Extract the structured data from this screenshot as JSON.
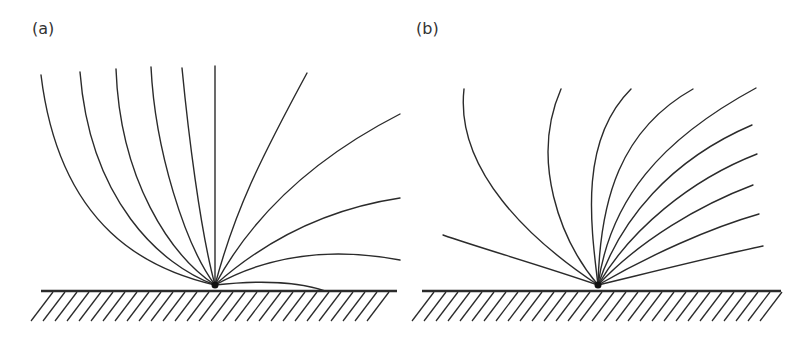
{
  "panels": [
    {
      "label": "(a)",
      "source_point": [
        215,
        285
      ],
      "ground": {
        "x1": 41,
        "x2": 397,
        "y": 291
      },
      "curves": [
        "M215,285 C150,270 60,230 41,75",
        "M215,285 C160,265 90,200 80,72",
        "M215,285 C170,255 120,180 116,69",
        "M215,285 C185,245 155,150 151,67",
        "M215,285 C200,230 188,130 182,68",
        "M215,285 L215,66",
        "M215,285 C235,210 260,160 307,73",
        "M215,285 C250,220 310,160 400,114",
        "M215,285 C260,245 320,210 400,198",
        "M215,285 C260,260 320,245 400,260",
        "M215,285 C260,280 300,282 325,291"
      ]
    },
    {
      "label": "(b)",
      "source_point": [
        598,
        285
      ],
      "ground": {
        "x1": 422,
        "x2": 781,
        "y": 291
      },
      "curves": [
        "M598,285 C540,265 480,248 443,235",
        "M598,285 C530,240 455,170 464,89",
        "M598,285 C560,240 530,160 561,89",
        "M598,285 C590,220 580,140 631,89",
        "M598,285 C600,200 620,130 693,89",
        "M598,285 C610,200 660,140 756,88",
        "M598,285 C620,220 670,160 752,125",
        "M598,285 C630,230 690,180 757,154",
        "M598,285 C640,240 700,205 753,185",
        "M598,285 C650,255 710,228 759,214",
        "M598,285 C660,270 720,255 763,246"
      ]
    }
  ],
  "style": {
    "line_color": "#2b2b2b",
    "background": "#ffffff"
  }
}
